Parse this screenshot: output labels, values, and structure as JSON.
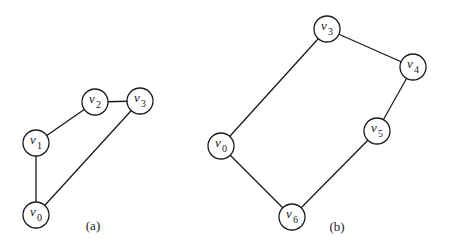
{
  "graphs": [
    {
      "caption": "(a)",
      "caption_pos": [
        93,
        230
      ],
      "nodes": [
        {
          "id": "v0",
          "base": "v",
          "sub": "0",
          "x": 36,
          "y": 215
        },
        {
          "id": "v1",
          "base": "v",
          "sub": "1",
          "x": 36,
          "y": 143
        },
        {
          "id": "v2",
          "base": "v",
          "sub": "2",
          "x": 95,
          "y": 102
        },
        {
          "id": "v3",
          "base": "v",
          "sub": "3",
          "x": 140,
          "y": 101
        }
      ],
      "edges": [
        [
          "v0",
          "v1"
        ],
        [
          "v1",
          "v2"
        ],
        [
          "v2",
          "v3"
        ],
        [
          "v3",
          "v0"
        ]
      ]
    },
    {
      "caption": "(b)",
      "caption_pos": [
        337,
        231
      ],
      "nodes": [
        {
          "id": "v3",
          "base": "v",
          "sub": "3",
          "x": 327,
          "y": 29
        },
        {
          "id": "v4",
          "base": "v",
          "sub": "4",
          "x": 413,
          "y": 67
        },
        {
          "id": "v5",
          "base": "v",
          "sub": "5",
          "x": 377,
          "y": 131
        },
        {
          "id": "v0",
          "base": "v",
          "sub": "0",
          "x": 221,
          "y": 146
        },
        {
          "id": "v6",
          "base": "v",
          "sub": "6",
          "x": 292,
          "y": 217
        }
      ],
      "edges": [
        [
          "v3",
          "v4"
        ],
        [
          "v4",
          "v5"
        ],
        [
          "v5",
          "v6"
        ],
        [
          "v6",
          "v0"
        ],
        [
          "v0",
          "v3"
        ]
      ]
    }
  ],
  "node_radius": 13
}
